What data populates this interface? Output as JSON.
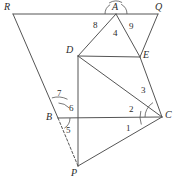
{
  "figure": {
    "stroke_color": "#555555",
    "label_color": "#2b2b2b",
    "background_color": "#ffffff",
    "width": 176,
    "height": 184
  },
  "vertices": [
    {
      "id": "R",
      "label": "R",
      "x": 13,
      "y": 14,
      "label_x": 4,
      "label_y": 2
    },
    {
      "id": "Q",
      "label": "Q",
      "x": 158,
      "y": 14,
      "label_x": 155,
      "label_y": 2
    },
    {
      "id": "A",
      "label": "A",
      "x": 116,
      "y": 14,
      "label_x": 112,
      "label_y": 2
    },
    {
      "id": "D",
      "label": "D",
      "x": 78,
      "y": 56,
      "label_x": 66,
      "label_y": 45
    },
    {
      "id": "E",
      "label": "E",
      "x": 140,
      "y": 57,
      "label_x": 143,
      "label_y": 50
    },
    {
      "id": "B",
      "label": "B",
      "x": 58,
      "y": 118,
      "label_x": 46,
      "label_y": 112
    },
    {
      "id": "C",
      "label": "C",
      "x": 162,
      "y": 117,
      "label_x": 165,
      "label_y": 110
    },
    {
      "id": "P",
      "label": "P",
      "x": 78,
      "y": 166,
      "label_x": 71,
      "label_y": 168
    }
  ],
  "segments": [
    {
      "id": "RQ",
      "from": "R",
      "to": "Q",
      "style": "solid"
    },
    {
      "id": "RB",
      "from": "R",
      "to": "B",
      "style": "solid"
    },
    {
      "id": "AD",
      "from": "A",
      "to": "D",
      "style": "solid"
    },
    {
      "id": "AE",
      "from": "A",
      "to": "E",
      "style": "solid"
    },
    {
      "id": "QE",
      "from": "Q",
      "to": "E",
      "style": "solid"
    },
    {
      "id": "DE",
      "from": "D",
      "to": "E",
      "style": "solid"
    },
    {
      "id": "DC",
      "from": "D",
      "to": "C",
      "style": "solid"
    },
    {
      "id": "DP",
      "from": "D",
      "to": "P",
      "style": "solid"
    },
    {
      "id": "EC",
      "from": "E",
      "to": "C",
      "style": "solid"
    },
    {
      "id": "BC",
      "from": "B",
      "to": "C",
      "style": "solid"
    },
    {
      "id": "PC",
      "from": "P",
      "to": "C",
      "style": "solid"
    },
    {
      "id": "BP",
      "from": "B",
      "to": "P",
      "style": "dashed"
    }
  ],
  "angle_labels": [
    {
      "id": "angle-1",
      "text": "1",
      "x": 126,
      "y": 124
    },
    {
      "id": "angle-2",
      "text": "2",
      "x": 129,
      "y": 105
    },
    {
      "id": "angle-3",
      "text": "3",
      "x": 141,
      "y": 86
    },
    {
      "id": "angle-4",
      "text": "4",
      "x": 113,
      "y": 29
    },
    {
      "id": "angle-5",
      "text": "5",
      "x": 66,
      "y": 126
    },
    {
      "id": "angle-6",
      "text": "6",
      "x": 69,
      "y": 104
    },
    {
      "id": "angle-7",
      "text": "7",
      "x": 57,
      "y": 89
    },
    {
      "id": "angle-8",
      "text": "8",
      "x": 93,
      "y": 21
    },
    {
      "id": "angle-9",
      "text": "9",
      "x": 129,
      "y": 22
    }
  ],
  "angle_arcs": [
    {
      "id": "arc-A-left",
      "cx": 116,
      "cy": 14,
      "r": 11,
      "start_deg": 180,
      "end_deg": 238
    },
    {
      "id": "arc-A-middle",
      "cx": 116,
      "cy": 14,
      "r": 13,
      "start_deg": 238,
      "end_deg": 298
    },
    {
      "id": "arc-A-right",
      "cx": 116,
      "cy": 14,
      "r": 11,
      "start_deg": 298,
      "end_deg": 360
    },
    {
      "id": "arc-C-1",
      "cx": 162,
      "cy": 117,
      "r": 22,
      "start_deg": 160,
      "end_deg": 196
    },
    {
      "id": "arc-C-2",
      "cx": 162,
      "cy": 117,
      "r": 17,
      "start_deg": 180,
      "end_deg": 206
    },
    {
      "id": "arc-C-3",
      "cx": 162,
      "cy": 117,
      "r": 17,
      "start_deg": 206,
      "end_deg": 238
    },
    {
      "id": "arc-B-7",
      "cx": 58,
      "cy": 118,
      "r": 21,
      "start_deg": 253,
      "end_deg": 297
    },
    {
      "id": "arc-B-6",
      "cx": 58,
      "cy": 118,
      "r": 15,
      "start_deg": 272,
      "end_deg": 317
    },
    {
      "id": "arc-B-5",
      "cx": 58,
      "cy": 118,
      "r": 12,
      "start_deg": 0,
      "end_deg": 58
    }
  ]
}
